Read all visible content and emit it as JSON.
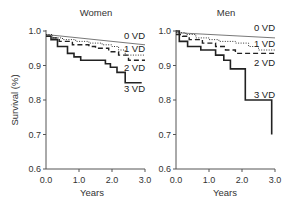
{
  "chart_data": [
    {
      "type": "line",
      "step": true,
      "title": "Women",
      "xlabel": "Years",
      "ylabel": "Survival (%)",
      "xlim": [
        0.0,
        3.0
      ],
      "ylim": [
        0.6,
        1.0
      ],
      "xticks": [
        "0.0",
        "1.0",
        "2.0",
        "3.0"
      ],
      "yticks": [
        "0.6",
        "0.7",
        "0.8",
        "0.9",
        "1.0"
      ],
      "grid": false,
      "legend_position": "inline-right",
      "series": [
        {
          "name": "0 VD",
          "style": "thin-solid",
          "x": [
            0.0,
            3.0
          ],
          "y": [
            0.99,
            0.96
          ]
        },
        {
          "name": "1 VD",
          "style": "dotted",
          "x": [
            0.0,
            0.2,
            0.5,
            0.9,
            1.3,
            1.7,
            2.0,
            2.2,
            2.4,
            3.0
          ],
          "y": [
            0.99,
            0.98,
            0.975,
            0.97,
            0.965,
            0.96,
            0.955,
            0.945,
            0.93,
            0.93
          ]
        },
        {
          "name": "2 VD",
          "style": "dashed",
          "x": [
            0.0,
            0.2,
            0.4,
            0.8,
            1.3,
            1.5,
            1.9,
            2.2,
            2.5,
            3.0
          ],
          "y": [
            0.985,
            0.98,
            0.97,
            0.96,
            0.955,
            0.95,
            0.94,
            0.93,
            0.915,
            0.915
          ]
        },
        {
          "name": "3 VD",
          "style": "thick-solid",
          "x": [
            0.0,
            0.15,
            0.35,
            0.65,
            0.85,
            1.05,
            1.8,
            1.95,
            2.15,
            2.4,
            2.9
          ],
          "y": [
            0.985,
            0.975,
            0.955,
            0.935,
            0.925,
            0.915,
            0.905,
            0.895,
            0.88,
            0.85,
            0.85
          ]
        }
      ]
    },
    {
      "type": "line",
      "step": true,
      "title": "Men",
      "xlabel": "Years",
      "ylabel": "",
      "xlim": [
        0.0,
        3.0
      ],
      "ylim": [
        0.6,
        1.0
      ],
      "xticks": [
        "0.0",
        "1.0",
        "2.0",
        "3.0"
      ],
      "yticks": [
        "0.6",
        "0.7",
        "0.8",
        "0.9",
        "1.0"
      ],
      "grid": false,
      "legend_position": "inline-right",
      "series": [
        {
          "name": "0 VD",
          "style": "thin-solid",
          "x": [
            0.0,
            3.0
          ],
          "y": [
            0.995,
            0.98
          ]
        },
        {
          "name": "1 VD",
          "style": "dotted",
          "x": [
            0.0,
            0.3,
            0.6,
            1.0,
            1.3,
            1.8,
            2.2,
            2.5,
            3.0
          ],
          "y": [
            0.995,
            0.99,
            0.98,
            0.975,
            0.97,
            0.965,
            0.955,
            0.945,
            0.945
          ]
        },
        {
          "name": "2 VD",
          "style": "dashed",
          "x": [
            0.0,
            0.2,
            0.4,
            0.8,
            1.2,
            1.5,
            1.8,
            3.0
          ],
          "y": [
            0.99,
            0.985,
            0.975,
            0.965,
            0.955,
            0.945,
            0.935,
            0.935
          ]
        },
        {
          "name": "3 VD",
          "style": "thick-solid",
          "x": [
            0.0,
            0.1,
            0.35,
            0.75,
            1.2,
            1.45,
            1.65,
            2.1,
            2.85,
            2.9
          ],
          "y": [
            1.0,
            0.97,
            0.955,
            0.945,
            0.93,
            0.915,
            0.89,
            0.8,
            0.8,
            0.7
          ]
        }
      ]
    }
  ],
  "panels": {
    "left": {
      "title": "Women",
      "xlabel": "Years",
      "ylabel": "Survival (%)"
    },
    "right": {
      "title": "Men",
      "xlabel": "Years"
    }
  },
  "series_labels": {
    "vd0": "0 VD",
    "vd1": "1 VD",
    "vd2": "2 VD",
    "vd3": "3 VD"
  },
  "ticks": {
    "x": [
      "0.0",
      "1.0",
      "2.0",
      "3.0"
    ],
    "y": [
      "1.0",
      "0.9",
      "0.8",
      "0.7",
      "0.6"
    ]
  },
  "colors": {
    "line": "#222222",
    "axis": "#555555",
    "text": "#333333"
  }
}
